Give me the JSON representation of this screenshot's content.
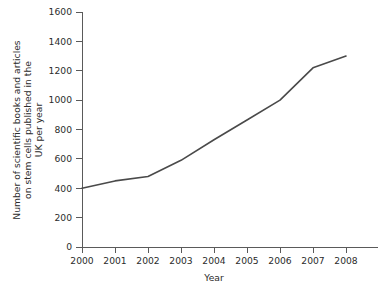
{
  "chart_data": {
    "type": "line",
    "title": "",
    "xlabel": "Year",
    "ylabel": "Number of scientific books and articles on stem cells published in the UK per year",
    "ylabel_lines": [
      "Number of scientific books and articles",
      "on stem cells published in the",
      "UK per year"
    ],
    "x": [
      2000,
      2001,
      2002,
      2003,
      2004,
      2005,
      2006,
      2007,
      2008
    ],
    "categories": [
      "2000",
      "2001",
      "2002",
      "2003",
      "2004",
      "2005",
      "2006",
      "2007",
      "2008"
    ],
    "values": [
      400,
      450,
      480,
      590,
      730,
      865,
      1000,
      1220,
      1300
    ],
    "series": [
      {
        "name": "Books and articles on stem cells",
        "values": [
          400,
          450,
          480,
          590,
          730,
          865,
          1000,
          1220,
          1300
        ]
      }
    ],
    "xlim": [
      2000,
      2008
    ],
    "ylim": [
      0,
      1600
    ],
    "ytick_labels": [
      "0",
      "200",
      "400",
      "600",
      "800",
      "1000",
      "1200",
      "1400",
      "1600"
    ],
    "yticks": [
      0,
      200,
      400,
      600,
      800,
      1000,
      1200,
      1400,
      1600
    ],
    "xtick_labels": [
      "2000",
      "2001",
      "2002",
      "2003",
      "2004",
      "2005",
      "2006",
      "2007",
      "2008"
    ],
    "grid": false,
    "legend": false,
    "legend_position": "none",
    "line_color": "#4a4a4a",
    "axis_color": "#5a5a5a",
    "background_color": "#ffffff"
  }
}
